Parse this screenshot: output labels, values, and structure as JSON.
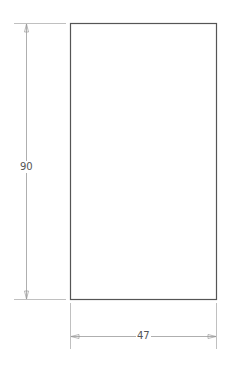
{
  "drawing": {
    "shape": "rectangle",
    "stroke_color": "#555555",
    "dimension_color": "#9a9a9a",
    "dimensions": {
      "height": {
        "label": "90",
        "orientation": "vertical"
      },
      "width": {
        "label": "47",
        "orientation": "horizontal"
      }
    }
  }
}
